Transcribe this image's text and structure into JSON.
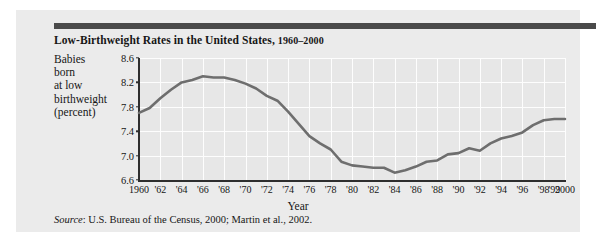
{
  "figure": {
    "title": "Low-Birthweight Rates in the United States, ",
    "title_years": "1960–2000",
    "ylabel_lines": [
      "Babies",
      "born",
      "at low",
      "birthweight",
      "(percent)"
    ],
    "source_label": "Source",
    "source_text": ": U.S. Bureau of the Census, 2000; Martin et al., 2002.",
    "accent_bar_color": "#4a4a4a",
    "card_color": "#ebebeb",
    "line_color": "#6e6e6e"
  },
  "chart_data": {
    "type": "line",
    "title": "Low-Birthweight Rates in the United States, 1960–2000",
    "xlabel": "Year",
    "ylabel": "Babies born at low birthweight (percent)",
    "ylim": [
      6.6,
      8.6
    ],
    "xlim": [
      1960,
      2000
    ],
    "grid": true,
    "legend": false,
    "ytick_labels": [
      "8.6",
      "8.2",
      "7.8",
      "7.4",
      "7.0",
      "6.6"
    ],
    "ytick_values": [
      8.6,
      8.2,
      7.8,
      7.4,
      7.0,
      6.6
    ],
    "xtick_labels": [
      "1960",
      "'62",
      "'64",
      "'66",
      "'68",
      "'70",
      "'72",
      "'74",
      "'76",
      "'78",
      "'80",
      "'82",
      "'84",
      "'86",
      "'88",
      "'90",
      "'92",
      "'94",
      "'96",
      "'98",
      "'99",
      "2000"
    ],
    "xtick_values": [
      1960,
      1962,
      1964,
      1966,
      1968,
      1970,
      1972,
      1974,
      1976,
      1978,
      1980,
      1982,
      1984,
      1986,
      1988,
      1990,
      1992,
      1994,
      1996,
      1998,
      1999,
      2000
    ],
    "x": [
      1960,
      1961,
      1962,
      1963,
      1964,
      1965,
      1966,
      1967,
      1968,
      1969,
      1970,
      1971,
      1972,
      1973,
      1974,
      1975,
      1976,
      1977,
      1978,
      1979,
      1980,
      1981,
      1982,
      1983,
      1984,
      1985,
      1986,
      1987,
      1988,
      1989,
      1990,
      1991,
      1992,
      1993,
      1994,
      1995,
      1996,
      1997,
      1998,
      1999,
      2000
    ],
    "values": [
      7.7,
      7.78,
      7.94,
      8.08,
      8.2,
      8.24,
      8.3,
      8.28,
      8.28,
      8.24,
      8.18,
      8.1,
      7.98,
      7.9,
      7.72,
      7.52,
      7.32,
      7.2,
      7.1,
      6.9,
      6.84,
      6.82,
      6.8,
      6.8,
      6.72,
      6.76,
      6.82,
      6.9,
      6.92,
      7.02,
      7.04,
      7.12,
      7.08,
      7.2,
      7.28,
      7.32,
      7.38,
      7.5,
      7.58,
      7.6,
      7.6
    ]
  }
}
